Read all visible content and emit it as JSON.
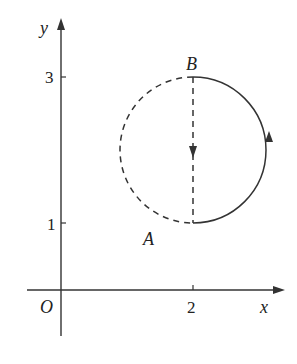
{
  "diagram": {
    "axes": {
      "x_label": "x",
      "y_label": "y",
      "origin_label": "O",
      "x_ticks": [
        {
          "value": 2,
          "label": "2"
        }
      ],
      "y_ticks": [
        {
          "value": 1,
          "label": "1"
        },
        {
          "value": 3,
          "label": "3"
        }
      ]
    },
    "points": {
      "A": {
        "label": "A",
        "coords": [
          2,
          1
        ]
      },
      "B": {
        "label": "B",
        "coords": [
          2,
          3
        ]
      }
    },
    "circle": {
      "center": [
        2,
        2
      ],
      "radius": 1,
      "right_half_style": "solid",
      "left_half_style": "dashed",
      "right_half_direction": "counterclockwise from A up to B",
      "diameter_style": "dashed",
      "diameter_direction": "from B down to A"
    },
    "colors": {
      "stroke": "#333333",
      "background": "#ffffff"
    }
  }
}
